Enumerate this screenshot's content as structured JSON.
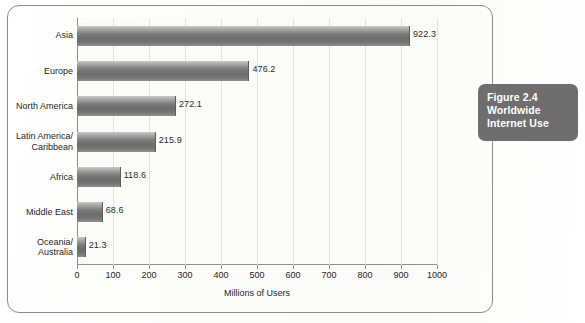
{
  "figure": {
    "caption_lines": [
      "Figure 2.4",
      "Worldwide",
      "Internet Use"
    ],
    "caption_bg_color": "#6e6e6e",
    "caption_text_color": "#ffffff",
    "frame_border_color": "#8c8c8c"
  },
  "chart_data": {
    "type": "bar",
    "orientation": "horizontal",
    "title": "",
    "subtitle": "",
    "xlabel": "Millions of Users",
    "ylabel": "",
    "categories": [
      "Asia",
      "Europe",
      "North America",
      "Latin America/\nCaribbean",
      "Africa",
      "Middle East",
      "Oceania/\nAustralia"
    ],
    "values": [
      922.3,
      476.2,
      272.1,
      215.9,
      118.6,
      68.6,
      21.3
    ],
    "value_labels": [
      "922.3",
      "476.2",
      "272.1",
      "215.9",
      "118.6",
      "68.6",
      "21.3"
    ],
    "xlim": [
      0,
      1000
    ],
    "xticks": [
      0,
      100,
      200,
      300,
      400,
      500,
      600,
      700,
      800,
      900,
      1000
    ],
    "xtick_labels": [
      "0",
      "100",
      "200",
      "300",
      "400",
      "500",
      "600",
      "700",
      "800",
      "900",
      "1000"
    ],
    "grid": true,
    "grid_axis": "x",
    "grid_color": "#e2e2e0",
    "legend": null,
    "bar_color": "#7c7c7c",
    "bar_gradient": true,
    "plot_bg_color": "#fbfbfa",
    "axis_color": "#8f8f8f"
  }
}
